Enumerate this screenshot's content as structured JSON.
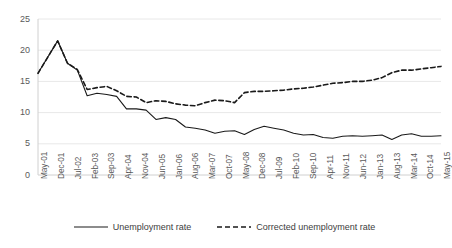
{
  "chart_data": {
    "type": "line",
    "title": "",
    "xlabel": "",
    "ylabel": "",
    "ylim": [
      0,
      25
    ],
    "yticks": [
      0,
      5,
      10,
      15,
      20,
      25
    ],
    "grid": true,
    "legend_position": "bottom",
    "categories": [
      "May-01",
      "Dec-01",
      "Jul-02",
      "Feb-03",
      "Sep-03",
      "Apr-04",
      "Nov-04",
      "Jun-05",
      "Jan-06",
      "Aug-06",
      "Mar-07",
      "Oct-07",
      "May-08",
      "Dec-08",
      "Jul-09",
      "Feb-10",
      "Sep-10",
      "Apr-11",
      "Nov-11",
      "Jun-12",
      "Jan-13",
      "Aug-13",
      "Mar-14",
      "Oct-14",
      "May-15"
    ],
    "series": [
      {
        "name": "Unemployment rate",
        "style": "solid",
        "color": "#1a1a1a",
        "values": [
          16.3,
          18.9,
          21.5,
          17.9,
          16.8,
          12.7,
          13.1,
          12.9,
          12.6,
          10.6,
          10.6,
          10.4,
          8.9,
          9.2,
          8.9,
          7.7,
          7.5,
          7.2,
          6.7,
          7.0,
          7.1,
          6.5,
          7.3,
          7.8,
          7.5
        ]
      },
      {
        "name": "Corrected unemployment rate",
        "style": "dashed",
        "color": "#1a1a1a",
        "values": [
          16.3,
          18.9,
          21.5,
          17.9,
          16.9,
          13.7,
          14.0,
          14.2,
          13.5,
          12.6,
          12.5,
          11.6,
          11.9,
          11.8,
          11.4,
          11.2,
          11.1,
          11.6,
          12.0,
          11.9,
          11.6,
          13.2,
          13.4,
          13.4,
          13.5
        ]
      }
    ],
    "series_extra": {
      "unemployment_tail": [
        7.2,
        6.7,
        6.4,
        6.5,
        6.0,
        5.9,
        6.2,
        6.3,
        6.2,
        6.3,
        6.4,
        5.7,
        6.4,
        6.6,
        6.2,
        6.2,
        6.3
      ],
      "corrected_tail": [
        13.6,
        13.8,
        13.9,
        14.1,
        14.4,
        14.7,
        14.8,
        15.0,
        15.0,
        15.2,
        15.6,
        16.4,
        16.8,
        16.8,
        17.0,
        17.2,
        17.4
      ]
    }
  },
  "axes": {
    "y_tick_labels": [
      "25",
      "20",
      "15",
      "10",
      "5",
      "0"
    ],
    "x_tick_labels": [
      "May-01",
      "Dec-01",
      "Jul-02",
      "Feb-03",
      "Sep-03",
      "Apr-04",
      "Nov-04",
      "Jun-05",
      "Jan-06",
      "Aug-06",
      "Mar-07",
      "Oct-07",
      "May-08",
      "Dec-08",
      "Jul-09",
      "Feb-10",
      "Sep-10",
      "Apr-11",
      "Nov-11",
      "Jun-12",
      "Jan-13",
      "Aug-13",
      "Mar-14",
      "Oct-14",
      "May-15"
    ]
  },
  "legend": {
    "items": [
      {
        "label": "Unemployment rate",
        "style": "solid"
      },
      {
        "label": "Corrected unemployment rate",
        "style": "dashed"
      }
    ]
  },
  "colors": {
    "line": "#1a1a1a",
    "grid": "#e8e8e8",
    "axis": "#d0d0d0",
    "tick_text": "#5a5a5a",
    "legend_text": "#3d3d3d",
    "background": "#ffffff"
  }
}
